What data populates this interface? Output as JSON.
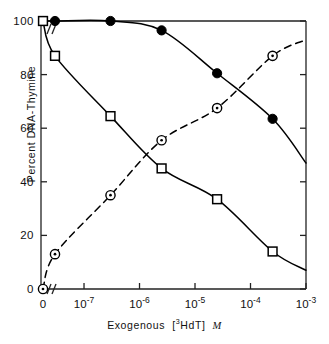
{
  "chart_data": {
    "type": "line",
    "title": "",
    "xlabel": "Exogenous [3HdT] M",
    "xlabel_parts": {
      "prefix": "Exogenous",
      "bracket_open": "[",
      "sup": "3",
      "isotope": "HdT",
      "bracket_close": "]",
      "units": "M"
    },
    "ylabel": "Percent DNA-Thymine",
    "ylim": [
      0,
      100
    ],
    "xscale": "log",
    "xlim": [
      3e-08,
      0.001
    ],
    "x_break": true,
    "grid": false,
    "legend": "none",
    "xticks": [
      {
        "value": 0,
        "label": "0",
        "exp": null,
        "broken": true
      },
      {
        "value": 1e-07,
        "label": "10",
        "exp": "-7"
      },
      {
        "value": 1e-06,
        "label": "10",
        "exp": "-6"
      },
      {
        "value": 1e-05,
        "label": "10",
        "exp": "-5"
      },
      {
        "value": 0.0001,
        "label": "10",
        "exp": "-4"
      },
      {
        "value": 0.001,
        "label": "10",
        "exp": "-3"
      }
    ],
    "yticks": [
      {
        "value": 0,
        "label": "0"
      },
      {
        "value": 20,
        "label": "20"
      },
      {
        "value": 40,
        "label": "40"
      },
      {
        "value": 60,
        "label": "60"
      },
      {
        "value": 80,
        "label": "80"
      },
      {
        "value": 100,
        "label": "100"
      }
    ],
    "series": [
      {
        "name": "filled-circle-series",
        "marker": "filled-circle",
        "linestyle": "solid",
        "color": "#000000",
        "points": [
          {
            "x": 0,
            "y": 100
          },
          {
            "x": 3e-08,
            "y": 100
          },
          {
            "x": 3e-07,
            "y": 100
          },
          {
            "x": 2.5e-06,
            "y": 96.5
          },
          {
            "x": 2.5e-05,
            "y": 80.5
          },
          {
            "x": 0.00025,
            "y": 63.5
          }
        ],
        "curve_end_y": 47
      },
      {
        "name": "open-square-series",
        "marker": "open-square",
        "linestyle": "solid",
        "color": "#000000",
        "points": [
          {
            "x": 0,
            "y": 100
          },
          {
            "x": 3e-08,
            "y": 87
          },
          {
            "x": 3e-07,
            "y": 64.5
          },
          {
            "x": 2.5e-06,
            "y": 45
          },
          {
            "x": 2.5e-05,
            "y": 33.5
          },
          {
            "x": 0.00025,
            "y": 14
          }
        ],
        "curve_end_y": 7
      },
      {
        "name": "circle-dot-series",
        "marker": "circle-dot",
        "linestyle": "dashed",
        "color": "#000000",
        "points": [
          {
            "x": 0,
            "y": 0
          },
          {
            "x": 3e-08,
            "y": 13
          },
          {
            "x": 3e-07,
            "y": 35
          },
          {
            "x": 2.5e-06,
            "y": 55.5
          },
          {
            "x": 2.5e-05,
            "y": 67.5
          },
          {
            "x": 0.00025,
            "y": 87
          }
        ],
        "curve_end_y": 93
      }
    ]
  }
}
